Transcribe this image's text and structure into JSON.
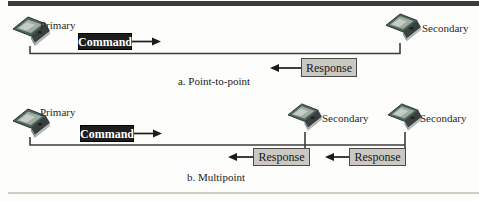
{
  "figure": {
    "point_to_point": {
      "caption": "a. Point-to-point",
      "primary_label": "Primary",
      "secondary_label": "Secondary",
      "command_label": "Command",
      "response_label": "Response"
    },
    "multipoint": {
      "caption": "b. Multipoint",
      "primary_label": "Primary",
      "secondary_1_label": "Secondary",
      "secondary_2_label": "Secondary",
      "command_label": "Command",
      "response_1_label": "Response",
      "response_2_label": "Response"
    }
  },
  "colors": {
    "top_rule": "#3d3d3d",
    "bottom_rule": "#d3cdc1",
    "command_box_bg": "#1d1d1d",
    "command_text": "#ffffff",
    "response_box_bg": "#cbc8c1",
    "response_box_border": "#4a4a4a",
    "connector_line": "#3c3c3c",
    "arrow": "#1c1c1c",
    "laptop_lid": "#4b645c"
  }
}
